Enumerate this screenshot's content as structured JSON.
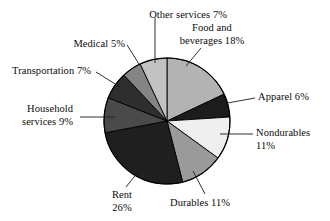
{
  "chart_data": {
    "type": "pie",
    "title": "",
    "subtitle": "",
    "xlabel": "",
    "ylabel": "",
    "legend_position": "none",
    "grid": false,
    "start_angle_deg": 0,
    "direction": "clockwise",
    "units": "percent",
    "total": 100,
    "categories": [
      "Food and beverages",
      "Apparel",
      "Nondurables",
      "Durables",
      "Rent",
      "Household services",
      "Transportation",
      "Medical",
      "Other services"
    ],
    "values": [
      18,
      6,
      11,
      11,
      26,
      9,
      7,
      5,
      7
    ],
    "slices": [
      {
        "name": "Food and beverages",
        "value": 18,
        "label_line1": "Food and",
        "label_line2": "beverages 18%",
        "color": "#b3b3b3",
        "label_x": 212,
        "label_y": 22,
        "label_align": "center",
        "leader": [
          201,
          48,
          186,
          66
        ]
      },
      {
        "name": "Apparel",
        "value": 6,
        "label_line1": "Apparel 6%",
        "label_line2": "",
        "color": "#1c1c1c",
        "label_x": 258,
        "label_y": 91,
        "label_align": "left",
        "leader": [
          255,
          98,
          222,
          104
        ]
      },
      {
        "name": "Nondurables",
        "value": 11,
        "label_line1": "Nondurables",
        "label_line2": "11%",
        "color": "#efefef",
        "label_x": 256,
        "label_y": 127,
        "label_align": "left",
        "leader": [
          253,
          134,
          220,
          134
        ]
      },
      {
        "name": "Durables",
        "value": 11,
        "label_line1": "Durables 11%",
        "label_line2": "",
        "color": "#9a9a9a",
        "label_x": 200,
        "label_y": 197,
        "label_align": "center",
        "leader": [
          205,
          194,
          193,
          171
        ]
      },
      {
        "name": "Rent",
        "value": 26,
        "label_line1": "Rent",
        "label_line2": "26%",
        "color": "#1f1f1f",
        "label_x": 122,
        "label_y": 189,
        "label_align": "center",
        "leader": [
          126,
          187,
          138,
          172
        ]
      },
      {
        "name": "Household services",
        "value": 9,
        "label_line1": "Household",
        "label_line2": "services 9%",
        "color": "#4a4a4a",
        "label_x": 73,
        "label_y": 103,
        "label_align": "right",
        "leader": [
          80,
          117,
          115,
          117
        ]
      },
      {
        "name": "Transportation",
        "value": 7,
        "label_line1": "Transportation 7%",
        "label_line2": "",
        "color": "#2e2e2e",
        "label_x": 91,
        "label_y": 65,
        "label_align": "right",
        "leader": [
          96,
          72,
          120,
          87
        ]
      },
      {
        "name": "Medical",
        "value": 5,
        "label_line1": "Medical 5%",
        "label_line2": "",
        "color": "#848484",
        "label_x": 125,
        "label_y": 38,
        "label_align": "right",
        "leader": [
          127,
          45,
          139,
          64
        ]
      },
      {
        "name": "Other services",
        "value": 7,
        "label_line1": "Other services 7%",
        "label_line2": "",
        "color": "#c2c2c2",
        "label_x": 227,
        "label_y": 9,
        "label_align": "right",
        "leader": [
          155,
          18,
          155,
          63
        ]
      }
    ],
    "geometry": {
      "center_x": 167,
      "center_y": 121,
      "radius": 63
    },
    "style": {
      "outline_color": "#000000",
      "background": "#ffffff",
      "leader_color": "#1a1a1a"
    }
  }
}
